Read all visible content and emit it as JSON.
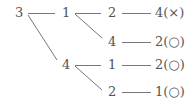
{
  "diagram": {
    "type": "tree",
    "line_color": "#777777",
    "text_color": "#555555",
    "nodes": {
      "root": "3",
      "l1_a": "1",
      "l1_b": "4",
      "l2_a": "2",
      "l2_b": "4",
      "l2_c": "1",
      "l2_d": "2",
      "leaf_a": "4(×)",
      "leaf_b": "2(○)",
      "leaf_c": "2(○)",
      "leaf_d": "1(○)"
    },
    "edges": [
      [
        "3",
        "1"
      ],
      [
        "3",
        "4"
      ],
      [
        "1",
        "2"
      ],
      [
        "1",
        "4"
      ],
      [
        "4",
        "1"
      ],
      [
        "4",
        "2"
      ],
      [
        "2",
        "4(×)"
      ],
      [
        "4",
        "2(○)"
      ],
      [
        "1",
        "2(○)"
      ],
      [
        "2",
        "1(○)"
      ]
    ]
  }
}
